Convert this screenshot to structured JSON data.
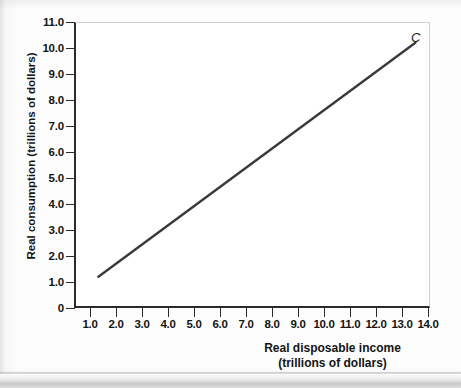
{
  "figure": {
    "curve_label": "C",
    "x_axis_title_line1": "Real disposable income",
    "x_axis_title_line2": "(trillions of dollars)",
    "y_axis_title": "Real consumption (trillions of dollars)",
    "line_color": "#3a3a3a",
    "axis_color": "#2b2b2b"
  },
  "chart_data": {
    "type": "line",
    "title": "",
    "xlabel": "Real disposable income (trillions of dollars)",
    "ylabel": "Real consumption (trillions of dollars)",
    "xlim": [
      0.0,
      14.6
    ],
    "ylim": [
      0,
      11.0
    ],
    "grid": false,
    "legend": "none",
    "x_ticks": [
      "1.0",
      "2.0",
      "3.0",
      "4.0",
      "5.0",
      "6.0",
      "7.0",
      "8.0",
      "9.0",
      "10.0",
      "11.0",
      "12.0",
      "13.0",
      "14.0"
    ],
    "x_tick_values": [
      1.0,
      2.0,
      3.0,
      4.0,
      5.0,
      6.0,
      7.0,
      8.0,
      9.0,
      10.0,
      11.0,
      12.0,
      13.0,
      14.0
    ],
    "y_ticks": [
      "0",
      "1.0",
      "2.0",
      "3.0",
      "4.0",
      "5.0",
      "6.0",
      "7.0",
      "8.0",
      "9.0",
      "10.0",
      "11.0"
    ],
    "y_tick_values": [
      0,
      1.0,
      2.0,
      3.0,
      4.0,
      5.0,
      6.0,
      7.0,
      8.0,
      9.0,
      10.0,
      11.0
    ],
    "series": [
      {
        "name": "C",
        "annotation": "C",
        "x": [
          1.0,
          14.0
        ],
        "y": [
          1.2,
          10.2
        ]
      }
    ]
  }
}
